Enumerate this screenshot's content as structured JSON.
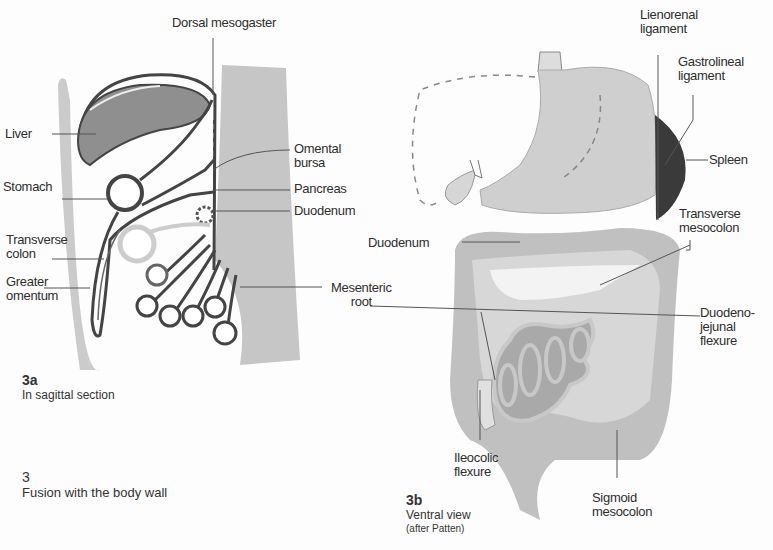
{
  "figure": {
    "number": "3",
    "caption": "Fusion with the body wall"
  },
  "panel_a": {
    "id": "3a",
    "caption": "In sagittal section",
    "labels": {
      "dorsal_mesogaster": "Dorsal mesogaster",
      "liver": "Liver",
      "stomach": "Stomach",
      "transverse_colon_1": "Transverse",
      "transverse_colon_2": "colon",
      "greater_omentum_1": "Greater",
      "greater_omentum_2": "omentum",
      "omental_bursa_1": "Omental",
      "omental_bursa_2": "bursa",
      "pancreas": "Pancreas",
      "duodenum": "Duodenum",
      "mesenteric_root_1": "Mesenteric",
      "mesenteric_root_2": "root"
    }
  },
  "panel_b": {
    "id": "3b",
    "caption": "Ventral view",
    "caption_note": "(after Patten)",
    "labels": {
      "lienorenal_1": "Lienorenal",
      "lienorenal_2": "ligament",
      "gastrolineal_1": "Gastrolineal",
      "gastrolineal_2": "ligament",
      "spleen": "Spleen",
      "transverse_mesocolon_1": "Transverse",
      "transverse_mesocolon_2": "mesocolon",
      "duodenum": "Duodenum",
      "duodenojejunal_1": "Duodeno-",
      "duodenojejunal_2": "jejunal",
      "duodenojejunal_3": "flexure",
      "ileocolic_1": "Ileocolic",
      "ileocolic_2": "flexure",
      "sigmoid_1": "Sigmoid",
      "sigmoid_2": "mesocolon"
    }
  },
  "colors": {
    "body_wall": "#c4c4c4",
    "organ_dark": "#8a8a8a",
    "organ_mid": "#b8b8b8",
    "organ_light": "#d4d4d4",
    "spleen": "#3a3a3a",
    "line": "#555555"
  }
}
